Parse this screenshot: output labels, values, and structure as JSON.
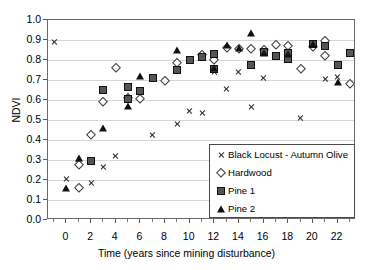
{
  "chart_data": {
    "type": "scatter",
    "title": "",
    "xlabel": "Time (years since mining disturbance)",
    "ylabel": "NDVI",
    "xlim": [
      -1.5,
      23.5
    ],
    "ylim": [
      0.0,
      1.0
    ],
    "grid": true,
    "legend_position": "inside-bottom-right",
    "xticks": [
      0,
      2,
      4,
      6,
      8,
      10,
      12,
      14,
      16,
      18,
      20,
      22
    ],
    "xtick_labels": [
      "0",
      "2",
      "4",
      "6",
      "8",
      "10",
      "12",
      "14",
      "16",
      "18",
      "20",
      "22"
    ],
    "xticks_minor": [
      -1,
      1,
      3,
      5,
      7,
      9,
      11,
      13,
      15,
      17,
      19,
      21,
      23
    ],
    "yticks": [
      0.0,
      0.1,
      0.2,
      0.3,
      0.4,
      0.5,
      0.6,
      0.7,
      0.8,
      0.9,
      1.0
    ],
    "ytick_labels": [
      "0.0",
      "0.1",
      "0.2",
      "0.3",
      "0.4",
      "0.5",
      "0.6",
      "0.7",
      "0.8",
      "0.9",
      "1.0"
    ],
    "series": [
      {
        "name": "Black Locust - Autumn Olive",
        "marker": "cross",
        "color": "#2b2b2b",
        "points": [
          [
            -1.0,
            0.89
          ],
          [
            0.0,
            0.205
          ],
          [
            1.0,
            0.285
          ],
          [
            2.0,
            0.183
          ],
          [
            3.0,
            0.266
          ],
          [
            4.0,
            0.318
          ],
          [
            7.0,
            0.423
          ],
          [
            9.0,
            0.482
          ],
          [
            10.0,
            0.547
          ],
          [
            11.0,
            0.534
          ],
          [
            12.0,
            0.738
          ],
          [
            13.0,
            0.656
          ],
          [
            14.0,
            0.741
          ],
          [
            15.0,
            0.567
          ],
          [
            16.0,
            0.708
          ],
          [
            19.0,
            0.512
          ],
          [
            21.0,
            0.705
          ],
          [
            22.0,
            0.717
          ]
        ]
      },
      {
        "name": "Hardwood",
        "marker": "diamond",
        "color": "#3a3a3a",
        "points": [
          [
            1.0,
            0.158
          ],
          [
            1.0,
            0.276
          ],
          [
            2.0,
            0.427
          ],
          [
            3.0,
            0.588
          ],
          [
            4.0,
            0.761
          ],
          [
            5.0,
            0.609
          ],
          [
            6.0,
            0.604
          ],
          [
            8.0,
            0.694
          ],
          [
            9.0,
            0.784
          ],
          [
            11.0,
            0.826
          ],
          [
            12.0,
            0.798
          ],
          [
            13.0,
            0.858
          ],
          [
            14.0,
            0.854
          ],
          [
            15.0,
            0.855
          ],
          [
            16.0,
            0.852
          ],
          [
            17.0,
            0.876
          ],
          [
            18.0,
            0.872
          ],
          [
            19.0,
            0.753
          ],
          [
            20.0,
            0.866
          ],
          [
            21.0,
            0.896
          ],
          [
            21.0,
            0.821
          ],
          [
            23.0,
            0.681
          ]
        ]
      },
      {
        "name": "Pine 1",
        "marker": "square",
        "color": "#555555",
        "points": [
          [
            2.0,
            0.297
          ],
          [
            3.0,
            0.651
          ],
          [
            5.0,
            0.606
          ],
          [
            5.0,
            0.665
          ],
          [
            6.0,
            0.645
          ],
          [
            7.0,
            0.711
          ],
          [
            9.0,
            0.75
          ],
          [
            10.0,
            0.802
          ],
          [
            11.0,
            0.814
          ],
          [
            12.0,
            0.829
          ],
          [
            12.0,
            0.757
          ],
          [
            15.0,
            0.777
          ],
          [
            16.0,
            0.838
          ],
          [
            17.0,
            0.822
          ],
          [
            18.0,
            0.834
          ],
          [
            18.0,
            0.806
          ],
          [
            20.0,
            0.878
          ],
          [
            21.0,
            0.868
          ],
          [
            22.0,
            0.777
          ],
          [
            23.0,
            0.833
          ]
        ]
      },
      {
        "name": "Pine 2",
        "marker": "triangle",
        "color": "#111111",
        "points": [
          [
            0.0,
            0.161
          ],
          [
            1.0,
            0.308
          ],
          [
            3.0,
            0.461
          ],
          [
            5.0,
            0.57
          ],
          [
            6.0,
            0.722
          ],
          [
            9.0,
            0.849
          ],
          [
            12.0,
            0.761
          ],
          [
            13.0,
            0.876
          ],
          [
            14.0,
            0.859
          ],
          [
            15.0,
            0.933
          ],
          [
            16.0,
            0.836
          ],
          [
            18.0,
            0.828
          ],
          [
            20.0,
            0.881
          ],
          [
            22.0,
            0.692
          ]
        ]
      }
    ]
  },
  "legend": {
    "entries": [
      {
        "label": "Black Locust - Autumn Olive",
        "marker": "cross"
      },
      {
        "label": "Hardwood",
        "marker": "diamond"
      },
      {
        "label": "Pine 1",
        "marker": "square"
      },
      {
        "label": "Pine 2",
        "marker": "triangle"
      }
    ]
  }
}
